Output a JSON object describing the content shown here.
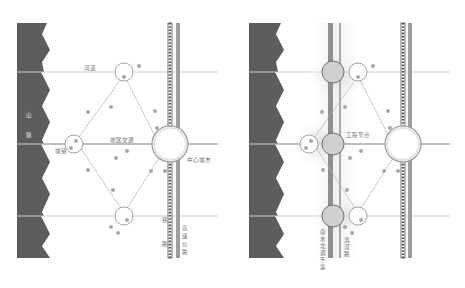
{
  "colors": {
    "mountain": "#5d5d5d",
    "line": "#c8c8c8",
    "node_stroke": "#8a8a8a",
    "dot": "#a6a6a6",
    "road_gray": "#9e9e9e",
    "canal_gray": "#8f8f8f",
    "halo": "#e3e3e3",
    "growth_fill": "#cfcfcf"
  },
  "left_panel": {
    "labels": {
      "river": "河道",
      "regional_traffic": "地区交通",
      "town": "城镇",
      "central_city": "中心城市",
      "mountain_1": "山",
      "mountain_2": "脉",
      "railway_1": "铁",
      "railway_2": "路",
      "expressway_1": "高",
      "expressway_2": "速",
      "expressway_3": "公",
      "expressway_4": "路"
    }
  },
  "right_panel": {
    "labels": {
      "engineering_node": "工程节点",
      "canal_1": "南",
      "canal_2": "水",
      "canal_3": "北",
      "canal_4": "调",
      "canal_5": "干",
      "canal_6": "渠",
      "riverside_1": "滨",
      "riverside_2": "河",
      "riverside_3": "路"
    }
  }
}
